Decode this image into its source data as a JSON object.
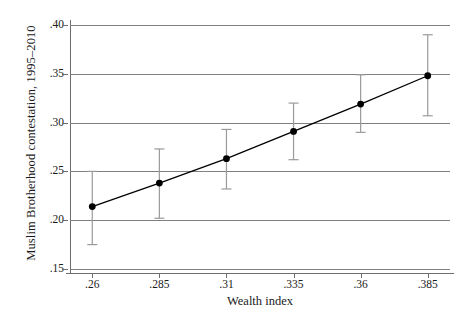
{
  "chart_data": {
    "type": "line",
    "title": "",
    "xlabel": "Wealth index",
    "ylabel": "Muslim Brotherhood contestation, 1995–2010",
    "xlim": [
      0.2517,
      0.3933
    ],
    "ylim": [
      0.15,
      0.4
    ],
    "grid": true,
    "grid_axis": "y",
    "legend": "none",
    "x_ticks": [
      ".26",
      ".285",
      ".31",
      ".335",
      ".36",
      ".385"
    ],
    "x_tick_values": [
      0.26,
      0.285,
      0.31,
      0.335,
      0.36,
      0.385
    ],
    "y_ticks": [
      ".15",
      ".20",
      ".25",
      ".30",
      ".35",
      ".40"
    ],
    "y_tick_values": [
      0.15,
      0.2,
      0.25,
      0.3,
      0.35,
      0.4
    ],
    "x": [
      0.26,
      0.285,
      0.31,
      0.335,
      0.36,
      0.385
    ],
    "values": [
      0.214,
      0.238,
      0.263,
      0.291,
      0.319,
      0.348
    ],
    "error_low": [
      0.175,
      0.202,
      0.232,
      0.262,
      0.29,
      0.307
    ],
    "error_high": [
      0.25,
      0.273,
      0.293,
      0.32,
      0.349,
      0.39
    ],
    "series": [
      {
        "name": "Predicted Muslim Brotherhood contestation",
        "values": [
          0.214,
          0.238,
          0.263,
          0.291,
          0.319,
          0.348
        ],
        "error_low": [
          0.175,
          0.202,
          0.232,
          0.262,
          0.29,
          0.307
        ],
        "error_high": [
          0.25,
          0.273,
          0.293,
          0.32,
          0.349,
          0.39
        ]
      }
    ],
    "marker": "filled-circle",
    "line_color": "#000000",
    "marker_color": "#000000",
    "error_bar_color": "#9a9a9a",
    "grid_color": "#808080",
    "background_color": "#ffffff"
  }
}
